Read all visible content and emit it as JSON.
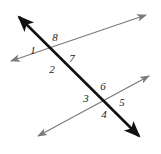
{
  "figure": {
    "width": 161,
    "height": 154,
    "background_color": "#ffffff"
  },
  "colors": {
    "transversal": "#111111",
    "parallel_lines": "#7a7a7a",
    "label_text": "#1a1a1a"
  },
  "lines": [
    {
      "id": "transversal",
      "name": "transversal-line",
      "color": "#111111",
      "stroke_width": 2.6,
      "arrow_start": true,
      "arrow_end": true,
      "x1": 19,
      "y1": 17,
      "x2": 139,
      "y2": 136
    },
    {
      "id": "parallel-upper",
      "name": "upper-parallel-line",
      "color": "#7a7a7a",
      "stroke_width": 1.25,
      "arrow_start": true,
      "arrow_end": true,
      "x1": 11,
      "y1": 61,
      "x2": 146,
      "y2": 15
    },
    {
      "id": "parallel-lower",
      "name": "lower-parallel-line",
      "color": "#7a7a7a",
      "stroke_width": 1.25,
      "arrow_start": true,
      "arrow_end": true,
      "x1": 38,
      "y1": 136,
      "x2": 149,
      "y2": 76
    }
  ],
  "intersections": [
    {
      "id": "upper",
      "name": "upper-intersection-point",
      "x": 55,
      "y": 55
    },
    {
      "id": "lower",
      "name": "lower-intersection-point",
      "x": 104,
      "y": 100
    }
  ],
  "angle_labels": [
    {
      "id": "a1",
      "text": "1",
      "x": 33,
      "y": 50,
      "intersection": "upper",
      "position": "left"
    },
    {
      "id": "a2",
      "text": "2",
      "x": 52,
      "y": 69,
      "intersection": "upper",
      "position": "bottom"
    },
    {
      "id": "a7",
      "text": "7",
      "x": 72,
      "y": 58,
      "intersection": "upper",
      "position": "right"
    },
    {
      "id": "a8",
      "text": "8",
      "x": 55,
      "y": 37,
      "intersection": "upper",
      "position": "top"
    },
    {
      "id": "a3",
      "text": "3",
      "x": 86,
      "y": 98,
      "intersection": "lower",
      "position": "left"
    },
    {
      "id": "a4",
      "text": "4",
      "x": 104,
      "y": 114,
      "intersection": "lower",
      "position": "bottom"
    },
    {
      "id": "a5",
      "text": "5",
      "x": 122,
      "y": 102,
      "intersection": "lower",
      "position": "right"
    },
    {
      "id": "a6",
      "text": "6",
      "x": 103,
      "y": 86,
      "intersection": "lower",
      "position": "top"
    }
  ]
}
